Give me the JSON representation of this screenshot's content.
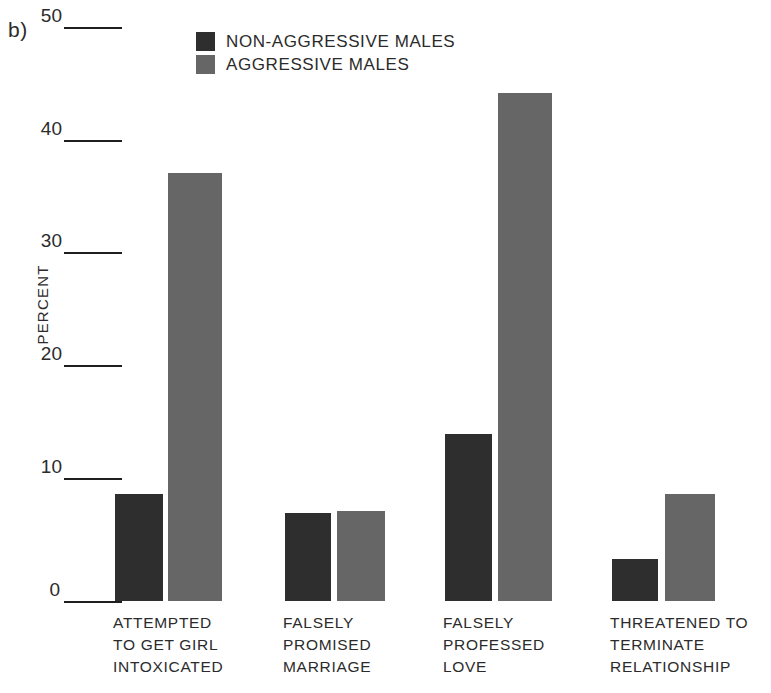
{
  "panel": {
    "letter": "b)"
  },
  "legend": {
    "items": [
      {
        "label": "NON-AGGRESSIVE MALES",
        "color": "#2e2e2e",
        "key": "non_aggressive"
      },
      {
        "label": "AGGRESSIVE MALES",
        "color": "#666666",
        "key": "aggressive"
      }
    ]
  },
  "axis": {
    "y_title": "PERCENT",
    "y_ticks": [
      "0",
      "10",
      "20",
      "30",
      "40",
      "50"
    ]
  },
  "chart_data": {
    "type": "bar",
    "title": "",
    "xlabel": "",
    "ylabel": "PERCENT",
    "ylim": [
      0,
      50
    ],
    "yticks": [
      0,
      10,
      20,
      30,
      40,
      50
    ],
    "grid": false,
    "legend_position": "top-center",
    "categories": [
      "ATTEMPTED TO GET GIRL INTOXICATED",
      "FALSELY PROMISED MARRIAGE",
      "FALSELY PROFESSED LOVE",
      "THREATENED TO TERMINATE RELATIONSHIP"
    ],
    "category_lines": [
      [
        "ATTEMPTED",
        "TO GET GIRL",
        "INTOXICATED"
      ],
      [
        "FALSELY",
        "PROMISED",
        "MARRIAGE"
      ],
      [
        "FALSELY",
        "PROFESSED",
        "LOVE"
      ],
      [
        "THREATENED TO",
        "TERMINATE",
        "RELATIONSHIP"
      ]
    ],
    "series": [
      {
        "name": "NON-AGGRESSIVE MALES",
        "color": "#2e2e2e",
        "values": [
          9.5,
          7.8,
          14.8,
          3.7
        ]
      },
      {
        "name": "AGGRESSIVE MALES",
        "color": "#666666",
        "values": [
          38.0,
          8.0,
          45.1,
          9.5
        ]
      }
    ]
  },
  "geometry": {
    "baseline_y": 601,
    "px_per_unit": 11.26,
    "bars": [
      {
        "group": 0,
        "series": 0,
        "left": 115,
        "width": 48
      },
      {
        "group": 0,
        "series": 1,
        "left": 168,
        "width": 54
      },
      {
        "group": 1,
        "series": 0,
        "left": 285,
        "width": 46
      },
      {
        "group": 1,
        "series": 1,
        "left": 337,
        "width": 48
      },
      {
        "group": 2,
        "series": 0,
        "left": 445,
        "width": 47
      },
      {
        "group": 2,
        "series": 1,
        "left": 498,
        "width": 54
      },
      {
        "group": 3,
        "series": 0,
        "left": 612,
        "width": 46
      },
      {
        "group": 3,
        "series": 1,
        "left": 665,
        "width": 50
      }
    ],
    "tick_y": {
      "0": 601,
      "10": 478,
      "20": 365,
      "30": 252,
      "40": 140,
      "50": 27
    },
    "xlabel_left": [
      113,
      283,
      443,
      610
    ]
  }
}
